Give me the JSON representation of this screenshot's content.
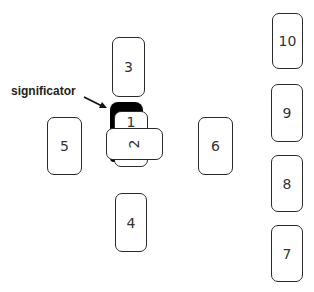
{
  "diagram": {
    "type": "tarot-spread",
    "label": "significator",
    "cards": [
      {
        "id": 1,
        "label": "1"
      },
      {
        "id": 2,
        "label": "2"
      },
      {
        "id": 3,
        "label": "3"
      },
      {
        "id": 4,
        "label": "4"
      },
      {
        "id": 5,
        "label": "5"
      },
      {
        "id": 6,
        "label": "6"
      },
      {
        "id": 7,
        "label": "7"
      },
      {
        "id": 8,
        "label": "8"
      },
      {
        "id": 9,
        "label": "9"
      },
      {
        "id": 10,
        "label": "10"
      }
    ],
    "colors": {
      "significator": "#000000",
      "card_border": "#2a2a2a",
      "text": "#333333"
    }
  }
}
